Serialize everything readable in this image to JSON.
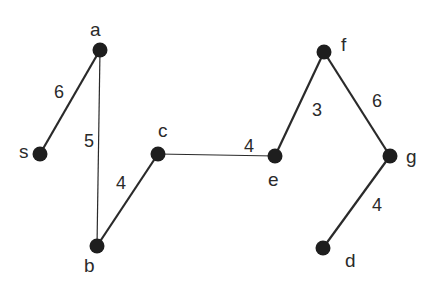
{
  "graph": {
    "nodes": [
      {
        "id": "a",
        "label": "a",
        "x": 100,
        "y": 50,
        "lx": 90,
        "ly": 36
      },
      {
        "id": "s",
        "label": "s",
        "x": 40,
        "y": 154,
        "lx": 19,
        "ly": 158
      },
      {
        "id": "b",
        "label": "b",
        "x": 97,
        "y": 246,
        "lx": 84,
        "ly": 272
      },
      {
        "id": "c",
        "label": "c",
        "x": 158,
        "y": 154,
        "lx": 158,
        "ly": 137
      },
      {
        "id": "e",
        "label": "e",
        "x": 275,
        "y": 156,
        "lx": 268,
        "ly": 186
      },
      {
        "id": "f",
        "label": "f",
        "x": 324,
        "y": 52,
        "lx": 341,
        "ly": 51
      },
      {
        "id": "g",
        "label": "g",
        "x": 390,
        "y": 156,
        "lx": 406,
        "ly": 163
      },
      {
        "id": "d",
        "label": "d",
        "x": 323,
        "y": 248,
        "lx": 345,
        "ly": 267
      }
    ],
    "edges": [
      {
        "from": "s",
        "to": "a",
        "weight": "6",
        "wx": 54,
        "wy": 98,
        "width": 2.2
      },
      {
        "from": "a",
        "to": "b",
        "weight": "5",
        "wx": 84,
        "wy": 147,
        "width": 1.2
      },
      {
        "from": "b",
        "to": "c",
        "weight": "4",
        "wx": 116,
        "wy": 189,
        "width": 2.2
      },
      {
        "from": "c",
        "to": "e",
        "weight": "4",
        "wx": 244,
        "wy": 152,
        "width": 1.2
      },
      {
        "from": "e",
        "to": "f",
        "weight": "3",
        "wx": 312,
        "wy": 116,
        "width": 2.2
      },
      {
        "from": "f",
        "to": "g",
        "weight": "6",
        "wx": 372,
        "wy": 107,
        "width": 2.2
      },
      {
        "from": "g",
        "to": "d",
        "weight": "4",
        "wx": 372,
        "wy": 211,
        "width": 2.2
      }
    ],
    "colors": {
      "node": "#1e1e1e",
      "edge": "#2a2a2a",
      "text": "#2a2a2a"
    }
  }
}
